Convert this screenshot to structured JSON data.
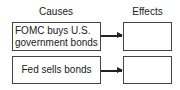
{
  "headers": {
    "causes": "Causes",
    "effects": "Effects"
  },
  "causes": [
    {
      "line1": "FOMC buys U.S.",
      "line2": "government bonds"
    },
    {
      "line1": "Fed sells bonds"
    }
  ],
  "effects": [
    {
      "text": ""
    },
    {
      "text": ""
    }
  ]
}
